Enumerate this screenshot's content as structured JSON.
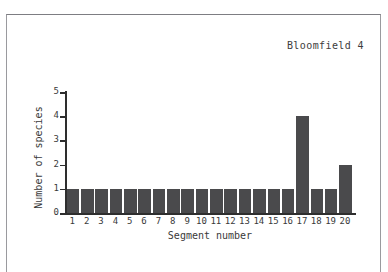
{
  "chart_data": {
    "type": "bar",
    "title": "Bloomfield 4",
    "xlabel": "Segment number",
    "ylabel": "Number of species",
    "categories": [
      "1",
      "2",
      "3",
      "4",
      "5",
      "6",
      "7",
      "8",
      "9",
      "10",
      "11",
      "12",
      "13",
      "14",
      "15",
      "16",
      "17",
      "18",
      "19",
      "20"
    ],
    "values": [
      1,
      1,
      1,
      1,
      1,
      1,
      1,
      1,
      1,
      1,
      1,
      1,
      1,
      1,
      1,
      1,
      4,
      1,
      1,
      2
    ],
    "ylim": [
      0,
      5
    ],
    "y_ticks": [
      "0",
      "1",
      "2",
      "3",
      "4",
      "5"
    ],
    "grid": false,
    "legend": null,
    "bar_color": "#4a4a4c",
    "axis_color": "#2e2e2e",
    "background": "#ffffff"
  },
  "figure": {
    "frame_border_color": "#9a9a9e"
  }
}
